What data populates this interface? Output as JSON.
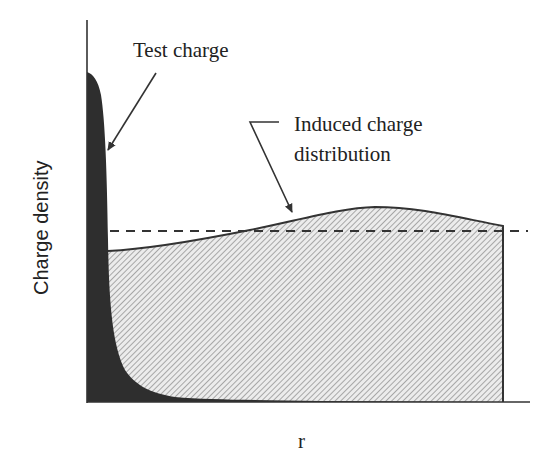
{
  "diagram": {
    "type": "charge-density-screening",
    "axes": {
      "y_label": "Charge density",
      "x_label": "r"
    },
    "annotations": {
      "test_charge": "Test charge",
      "induced_line1": "Induced charge",
      "induced_line2": "distribution"
    },
    "elements": [
      {
        "name": "test-charge-region",
        "fill": "dark solid",
        "description": "Sharp peak at r=0 decaying rapidly to zero"
      },
      {
        "name": "induced-charge-region",
        "fill": "diagonal hatch",
        "description": "Induced charge distribution, slightly rising then falling, bounded at right"
      },
      {
        "name": "dashed-reference-line",
        "style": "dashed",
        "description": "Horizontal uniform background level"
      }
    ],
    "colors": {
      "test_charge_fill": "#2e2e2e",
      "hatch_line": "#8a8a8a",
      "hatch_bg": "#e9e9e9",
      "outline": "#333333",
      "text": "#222222"
    }
  }
}
